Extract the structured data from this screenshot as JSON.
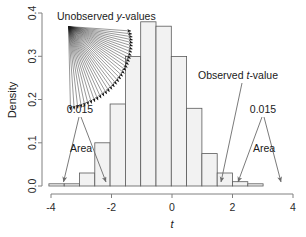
{
  "chart_data": {
    "type": "bar",
    "title": "",
    "xlabel": "t",
    "ylabel": "Density",
    "xlim": [
      -4.2,
      4.2
    ],
    "ylim": [
      0.0,
      0.4
    ],
    "grid": false,
    "legend_position": "none",
    "x_ticks": [
      "-4",
      "-2",
      "0",
      "2",
      "4"
    ],
    "x_tick_values": [
      -4,
      -2,
      0,
      2,
      4
    ],
    "y_ticks": [
      "0.0",
      "0.1",
      "0.2",
      "0.3",
      "0.4"
    ],
    "y_tick_values": [
      0.0,
      0.1,
      0.2,
      0.3,
      0.4
    ],
    "bin_width": 0.5,
    "bin_edges": [
      -3.5,
      -3.0,
      -2.5,
      -2.0,
      -1.5,
      -1.0,
      -0.5,
      0.0,
      0.5,
      1.0,
      1.5,
      2.0,
      2.5,
      3.0,
      3.5
    ],
    "categories": [
      "-3.25",
      "-2.75",
      "-2.25",
      "-1.75",
      "-1.25",
      "-0.75",
      "-0.25",
      "0.25",
      "0.75",
      "1.25",
      "1.75",
      "2.25",
      "2.75",
      "3.25"
    ],
    "values": [
      0.005,
      0.005,
      0.03,
      0.1,
      0.19,
      0.3,
      0.38,
      0.37,
      0.3,
      0.18,
      0.075,
      0.03,
      0.01,
      0.005
    ],
    "annotations": [
      {
        "name": "unobserved-y-values",
        "text": "Unobserved y-values",
        "italic_part": "y"
      },
      {
        "name": "observed-t-value",
        "text": "Observed t-value",
        "italic_part": "t"
      },
      {
        "name": "left-tail-prob",
        "text": "0.015"
      },
      {
        "name": "left-area",
        "text": "Area"
      },
      {
        "name": "right-tail-prob",
        "text": "0.015"
      },
      {
        "name": "right-area",
        "text": "Area"
      }
    ],
    "tail_probability": 0.015,
    "observed_t_value": 2.15,
    "colors": {
      "bar_fill": "#f2f2f2",
      "bar_stroke": "#5a5a5a",
      "axis": "#808080",
      "annotation": "#6b6b6b",
      "text": "#1a1a1a",
      "fan": "#1a1a1a"
    }
  },
  "axis": {
    "y_label": "Density",
    "x_label": "t",
    "y_tick_0": "0.0",
    "y_tick_1": "0.1",
    "y_tick_2": "0.2",
    "y_tick_3": "0.3",
    "y_tick_4": "0.4",
    "x_tick_0": "-4",
    "x_tick_1": "-2",
    "x_tick_2": "0",
    "x_tick_3": "2",
    "x_tick_4": "4"
  },
  "labels": {
    "unobserved_prefix": "Unobserved ",
    "unobserved_italic": "y",
    "unobserved_suffix": "-values",
    "observed_prefix": "Observed ",
    "observed_italic": "t",
    "observed_suffix": "-value",
    "left_prob": "0.015",
    "left_area": "Area",
    "right_prob": "0.015",
    "right_area": "Area"
  }
}
